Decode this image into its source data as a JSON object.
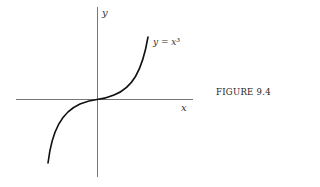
{
  "figure": {
    "caption": "FIGURE 9.4",
    "x_axis_label": "x",
    "y_axis_label": "y",
    "curve_label": "y = x³",
    "curve_equation": "y = x^3"
  },
  "colors": {
    "background": "#ffffff",
    "axis": "#555555",
    "curve": "#111111",
    "text": "#333333"
  }
}
